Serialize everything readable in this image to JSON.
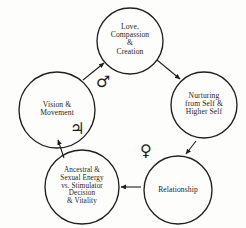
{
  "diagram": {
    "type": "cycle-diagram",
    "title": "",
    "stroke_color": "#1f1f1f",
    "background_color": "#fdfdfc",
    "text_color": "#1d1d1d",
    "nodes": [
      {
        "id": "love",
        "name": "love-compassion-creation",
        "label": "Love,\nCompassion\n&\nCreation",
        "cx": 130,
        "cy": 41,
        "r": 33,
        "font_size": 7.6
      },
      {
        "id": "nurturing",
        "name": "nurturing-from-self",
        "label": "Nurturing\nfrom Self &\nHigher Self",
        "cx": 204,
        "cy": 105,
        "r": 33,
        "font_size": 7.6
      },
      {
        "id": "relationship",
        "name": "relationship",
        "label": "Relationship",
        "cx": 178,
        "cy": 190,
        "r": 34,
        "font_size": 7.6
      },
      {
        "id": "ancestral",
        "name": "ancestral-sexual-energy",
        "label": "Ancestral &\nSexual Energy\nvs. Stimulator\nDecision\n& Vitality",
        "cx": 82,
        "cy": 187,
        "r": 37,
        "font_size": 7.2
      },
      {
        "id": "vision",
        "name": "vision-movement",
        "label": "Vision &\nMovement",
        "cx": 57,
        "cy": 110,
        "r": 38,
        "font_size": 7.6
      }
    ],
    "arrows": [
      {
        "id": "vision-to-love",
        "name": "arrow-vision-to-love",
        "from": "vision",
        "to": "love",
        "x1": 83,
        "y1": 80,
        "x2": 104,
        "y2": 63
      },
      {
        "id": "love-to-nurturing",
        "name": "arrow-love-to-nurturing",
        "from": "love",
        "to": "nurturing",
        "x1": 157,
        "y1": 60,
        "x2": 180,
        "y2": 79
      },
      {
        "id": "nurturing-to-relationship",
        "name": "arrow-nurturing-to-relationship",
        "from": "nurturing",
        "to": "relationship",
        "x1": 196,
        "y1": 141,
        "x2": 186,
        "y2": 154
      },
      {
        "id": "relationship-to-ancestral",
        "name": "arrow-relationship-to-ancestral",
        "from": "relationship",
        "to": "ancestral",
        "x1": 141,
        "y1": 187,
        "x2": 121,
        "y2": 187
      },
      {
        "id": "ancestral-to-vision",
        "name": "arrow-ancestral-to-vision",
        "from": "ancestral",
        "to": "vision",
        "x1": 64,
        "y1": 158,
        "x2": 58,
        "y2": 140
      }
    ],
    "symbols": [
      {
        "id": "mars",
        "name": "mars-symbol",
        "glyph": "♂",
        "meaning": "Mars",
        "x": 96,
        "y": 74,
        "font_size": 16
      },
      {
        "id": "jupiter",
        "name": "jupiter-symbol",
        "glyph": "♃",
        "meaning": "Jupiter",
        "x": 70,
        "y": 121,
        "font_size": 16
      },
      {
        "id": "venus",
        "name": "venus-symbol",
        "glyph": "♀",
        "meaning": "Venus",
        "x": 140,
        "y": 143,
        "font_size": 16
      }
    ]
  }
}
